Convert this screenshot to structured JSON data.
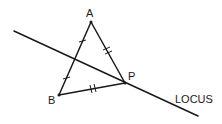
{
  "diagram": {
    "type": "geometry-construction",
    "points": {
      "A": {
        "label": "A",
        "x": 91,
        "y": 22
      },
      "B": {
        "label": "B",
        "x": 59,
        "y": 95
      },
      "P": {
        "label": "P",
        "x": 125,
        "y": 83
      }
    },
    "segments": [
      {
        "from": "A",
        "to": "B",
        "ticks": 1,
        "note": "AB bisected; each half marked with a single tick"
      },
      {
        "from": "A",
        "to": "P",
        "ticks": 2,
        "note": "equal length to BP"
      },
      {
        "from": "B",
        "to": "P",
        "ticks": 2,
        "note": "equal length to AP"
      }
    ],
    "locus": {
      "label": "LOCUS",
      "start": {
        "x": 14,
        "y": 31
      },
      "end": {
        "x": 198,
        "y": 116
      }
    },
    "labels": {
      "A": "A",
      "B": "B",
      "P": "P",
      "locus": "LOCUS"
    },
    "colors": {
      "stroke": "#1a1a1a",
      "background": "#ffffff"
    }
  }
}
